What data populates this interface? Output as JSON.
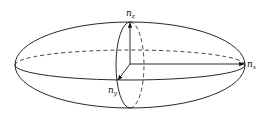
{
  "diagram": {
    "axes": [
      {
        "id": "x",
        "label_main": "n",
        "label_sub": "x"
      },
      {
        "id": "y",
        "label_main": "n",
        "label_sub": "y"
      },
      {
        "id": "z",
        "label_main": "n",
        "label_sub": "z"
      }
    ],
    "colors": {
      "stroke": "#111111",
      "background": "#ffffff"
    }
  }
}
